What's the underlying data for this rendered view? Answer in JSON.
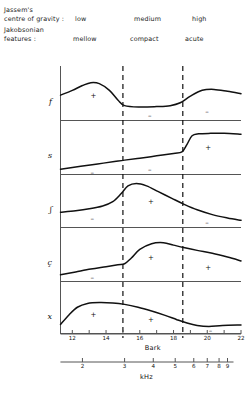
{
  "header": {
    "gravity_label": "Jassem's\ncentre of gravity :",
    "features_label": "Jakobsonian\nfeatures :",
    "gravity_categories": [
      "low",
      "medium",
      "high"
    ],
    "feature_categories": [
      "mellow",
      "compact",
      "acute"
    ]
  },
  "axes": {
    "bark": {
      "name": "Bark",
      "ticks": [
        12,
        13,
        14,
        15,
        16,
        17,
        18,
        19,
        20,
        21,
        22
      ],
      "labeled_ticks": [
        "12",
        "14",
        "16",
        "18",
        "20",
        "22"
      ],
      "min": 11.3,
      "max": 22
    },
    "khz": {
      "name": "kHz",
      "labeled_ticks": [
        "2",
        "3",
        "4",
        "5",
        "6",
        "7",
        "8",
        "9"
      ],
      "tick_bark_positions": [
        12.6,
        15.1,
        16.8,
        18.1,
        19.2,
        20.0,
        20.7,
        21.2
      ]
    },
    "dividers_bark": [
      15.0,
      18.55
    ]
  },
  "chart_data": {
    "type": "line",
    "title": "",
    "xlabel": "Bark",
    "ylabel": "",
    "grid": false,
    "legend": "none",
    "xlim": [
      11.3,
      22
    ],
    "panels": [
      {
        "label": "f",
        "signs": [
          {
            "value": "+",
            "region": "low",
            "x": 13.2
          },
          {
            "value": "–",
            "region": "medium",
            "x": 16.6
          },
          {
            "value": "–",
            "region": "high",
            "x": 20.0
          }
        ],
        "x": [
          11.3,
          12.0,
          12.6,
          13.1,
          13.6,
          14.2,
          14.7,
          15.1,
          16.0,
          17.0,
          17.8,
          18.4,
          19.0,
          19.7,
          20.4,
          21.2,
          22.0
        ],
        "y": [
          0.52,
          0.62,
          0.72,
          0.78,
          0.76,
          0.62,
          0.42,
          0.3,
          0.27,
          0.28,
          0.3,
          0.36,
          0.5,
          0.62,
          0.64,
          0.6,
          0.55
        ]
      },
      {
        "label": "s",
        "signs": [
          {
            "value": "–",
            "region": "low",
            "x": 13.2
          },
          {
            "value": "–",
            "region": "medium",
            "x": 16.6
          },
          {
            "value": "+",
            "region": "high",
            "x": 20.0
          }
        ],
        "x": [
          11.3,
          12.5,
          13.5,
          14.5,
          15.1,
          16.0,
          17.0,
          18.0,
          18.5,
          18.8,
          19.1,
          19.5,
          20.2,
          21.0,
          22.0
        ],
        "y": [
          0.1,
          0.16,
          0.21,
          0.26,
          0.29,
          0.33,
          0.38,
          0.43,
          0.46,
          0.62,
          0.8,
          0.84,
          0.85,
          0.85,
          0.83
        ]
      },
      {
        "label": "ʃ",
        "signs": [
          {
            "value": "–",
            "region": "low",
            "x": 13.2
          },
          {
            "value": "+",
            "region": "medium",
            "x": 16.6
          },
          {
            "value": "–",
            "region": "high",
            "x": 20.0
          }
        ],
        "x": [
          11.3,
          12.2,
          13.0,
          13.8,
          14.4,
          14.9,
          15.3,
          15.8,
          16.4,
          17.1,
          17.9,
          18.6,
          19.4,
          20.3,
          21.2,
          22.0
        ],
        "y": [
          0.33,
          0.36,
          0.4,
          0.46,
          0.55,
          0.72,
          0.88,
          0.93,
          0.88,
          0.76,
          0.62,
          0.5,
          0.38,
          0.28,
          0.21,
          0.16
        ]
      },
      {
        "label": "ç",
        "signs": [
          {
            "value": "–",
            "region": "low",
            "x": 13.2
          },
          {
            "value": "+",
            "region": "medium",
            "x": 16.6
          },
          {
            "value": "+",
            "region": "high",
            "x": 20.0
          }
        ],
        "x": [
          11.3,
          12.2,
          13.1,
          14.0,
          14.7,
          15.1,
          15.5,
          16.0,
          16.7,
          17.4,
          18.0,
          18.6,
          19.4,
          20.3,
          21.2,
          22.0
        ],
        "y": [
          0.13,
          0.19,
          0.25,
          0.3,
          0.34,
          0.36,
          0.48,
          0.66,
          0.78,
          0.8,
          0.75,
          0.7,
          0.64,
          0.58,
          0.5,
          0.42
        ]
      },
      {
        "label": "x",
        "signs": [
          {
            "value": "+",
            "region": "low",
            "x": 13.2
          },
          {
            "value": "+",
            "region": "medium",
            "x": 16.6
          },
          {
            "value": "–",
            "region": "high",
            "x": 20.2
          }
        ],
        "x": [
          11.3,
          11.8,
          12.3,
          12.9,
          13.6,
          14.4,
          15.1,
          15.9,
          16.7,
          17.5,
          18.2,
          18.8,
          19.4,
          20.1,
          20.9,
          22.0
        ],
        "y": [
          0.22,
          0.42,
          0.58,
          0.66,
          0.68,
          0.67,
          0.64,
          0.58,
          0.5,
          0.41,
          0.32,
          0.25,
          0.2,
          0.18,
          0.2,
          0.21
        ]
      }
    ]
  },
  "colors": {
    "curve": "#111111",
    "axis": "#555555",
    "divider": "#111111",
    "text": "#111111"
  }
}
